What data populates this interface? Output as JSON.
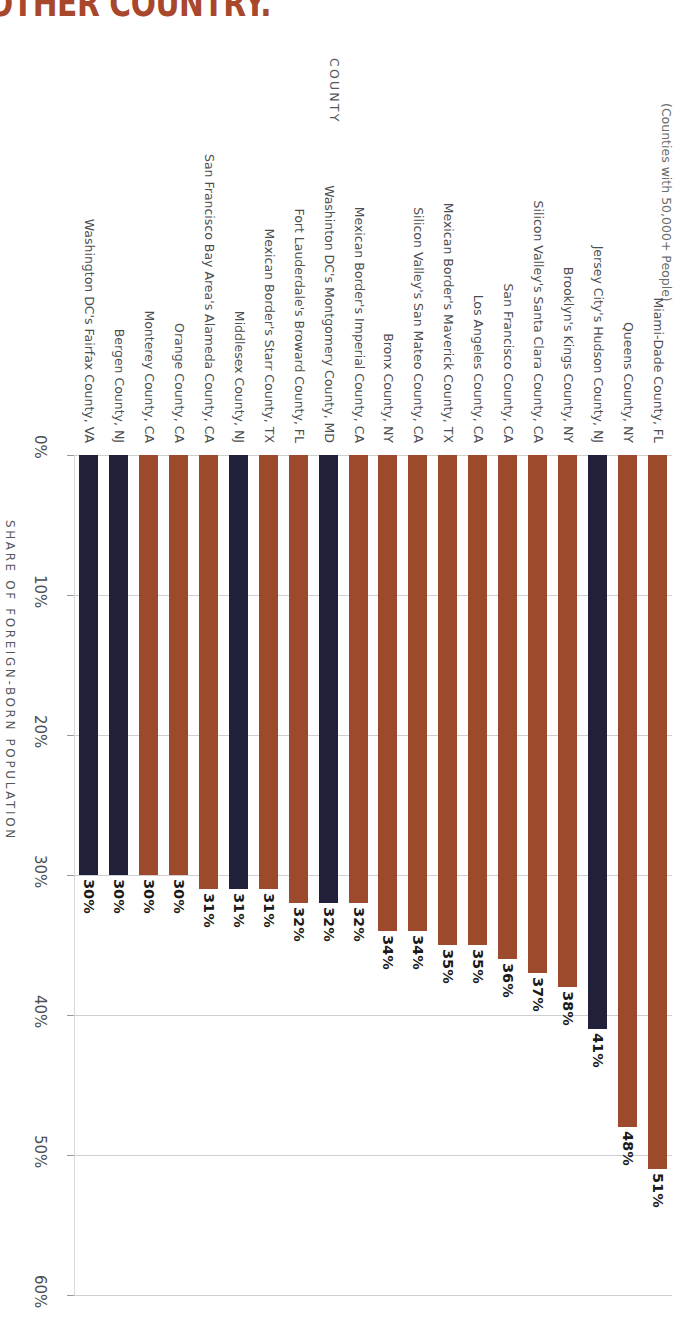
{
  "title_visible": "OTHER COUNTRY.",
  "colors": {
    "bar_brown": "#9c4a2b",
    "bar_navy": "#20203a",
    "title": "#a8472c",
    "grid": "#cfcfcf",
    "text": "#4b4d4f"
  },
  "axes": {
    "category_axis_title": "COUNTY",
    "category_axis_subtitle": "(Counties with 50,000+ People)",
    "value_axis_title": "SHARE OF FOREIGN-BORN POPULATION",
    "value_ticks": [
      "0%",
      "10%",
      "20%",
      "30%",
      "40%",
      "50%",
      "60%"
    ]
  },
  "chart_data": {
    "type": "bar",
    "subtitle": "(Counties with 50,000+ People)",
    "xlabel": "COUNTY",
    "ylabel": "SHARE OF FOREIGN-BORN POPULATION",
    "ylim": [
      0,
      60
    ],
    "yticks": [
      0,
      10,
      20,
      30,
      40,
      50,
      60
    ],
    "grid": true,
    "legend": false,
    "orientation": "vertical",
    "categories": [
      "Washington DC's Fairfax County, VA",
      "Bergen County, NJ",
      "Monterey County, CA",
      "Orange County, CA",
      "San Francisco Bay Area's Alameda County, CA",
      "Middlesex County, NJ",
      "Mexican Border's Starr County, TX",
      "Fort Lauderdale's Broward County, FL",
      "Washinton DC's Montgomery County, MD",
      "Mexican Border's Imperial County, CA",
      "Bronx County, NY",
      "Silicon Valley's San Mateo County, CA",
      "Mexican Border's Maverick County, TX",
      "Los Angeles County, CA",
      "San Francisco County, CA",
      "Silicon Valley's Santa Clara County, CA",
      "Brooklyn's Kings County, NY",
      "Jersey City's Hudson County, NJ",
      "Queens County, NY",
      "Miami-Dade County, FL"
    ],
    "values": [
      30,
      30,
      30,
      30,
      31,
      31,
      31,
      32,
      32,
      32,
      34,
      34,
      35,
      35,
      36,
      37,
      38,
      41,
      48,
      51
    ],
    "value_labels": [
      "30%",
      "30%",
      "30%",
      "30%",
      "31%",
      "31%",
      "31%",
      "32%",
      "32%",
      "32%",
      "34%",
      "34%",
      "35%",
      "35%",
      "36%",
      "37%",
      "38%",
      "41%",
      "48%",
      "51%"
    ],
    "bar_colors": [
      "navy",
      "navy",
      "brown",
      "brown",
      "brown",
      "navy",
      "brown",
      "brown",
      "navy",
      "brown",
      "brown",
      "brown",
      "brown",
      "brown",
      "brown",
      "brown",
      "brown",
      "navy",
      "brown",
      "brown"
    ]
  }
}
